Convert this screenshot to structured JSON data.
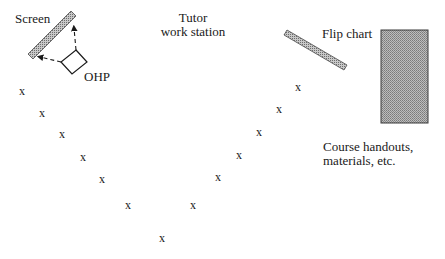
{
  "diagram": {
    "labels": {
      "screen": "Screen",
      "ohp": "OHP",
      "tutor_line1": "Tutor",
      "tutor_line2": "work station",
      "flip_chart": "Flip chart",
      "handouts_line1": "Course handouts,",
      "handouts_line2": "materials, etc."
    },
    "seat_marker": "x",
    "seats": [
      {
        "x": 22,
        "y": 91
      },
      {
        "x": 42,
        "y": 113
      },
      {
        "x": 62,
        "y": 134
      },
      {
        "x": 83,
        "y": 157
      },
      {
        "x": 102,
        "y": 179
      },
      {
        "x": 128,
        "y": 205
      },
      {
        "x": 162,
        "y": 238
      },
      {
        "x": 193,
        "y": 205
      },
      {
        "x": 218,
        "y": 177
      },
      {
        "x": 239,
        "y": 155
      },
      {
        "x": 259,
        "y": 132
      },
      {
        "x": 279,
        "y": 109
      },
      {
        "x": 298,
        "y": 87
      }
    ],
    "colors": {
      "ink": "#1a1a1a",
      "hatch": "#9a9a9a",
      "table_fill": "#a8a8a8"
    }
  }
}
